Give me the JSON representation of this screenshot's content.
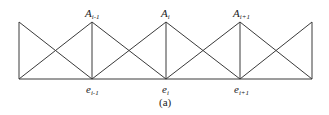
{
  "figure": {
    "caption": "(a)",
    "stroke_color": "#3a3a3a",
    "geometry": {
      "top_y": 22,
      "bottom_y": 79,
      "left_x": 19,
      "right_x": 312,
      "node_xs": [
        92,
        166,
        240
      ]
    },
    "top_labels": [
      {
        "base": "A",
        "sub": "i-1"
      },
      {
        "base": "A",
        "sub": "i"
      },
      {
        "base": "A",
        "sub": "i+1"
      }
    ],
    "bottom_labels": [
      {
        "base": "e",
        "sub": "i-1"
      },
      {
        "base": "e",
        "sub": "i"
      },
      {
        "base": "e",
        "sub": "i+1"
      }
    ]
  }
}
